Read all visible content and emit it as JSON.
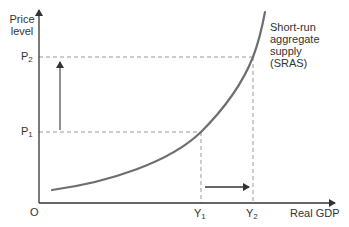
{
  "diagram": {
    "title": "Short-run aggregate supply (SRAS)",
    "y_axis": {
      "label_line1": "Price",
      "label_line2": "level"
    },
    "x_axis": {
      "label": "Real GDP",
      "origin": "O"
    },
    "curve": {
      "label_line1": "Short-run",
      "label_line2": "aggregate",
      "label_line3": "supply",
      "label_line4": "(SRAS)"
    },
    "price_levels": [
      {
        "base": "P",
        "sub": "1"
      },
      {
        "base": "P",
        "sub": "2"
      }
    ],
    "output_levels": [
      {
        "base": "Y",
        "sub": "1"
      },
      {
        "base": "Y",
        "sub": "2"
      }
    ],
    "colors": {
      "axis": "#333333",
      "curve": "#6e6e6e",
      "dashed": "#999999",
      "arrow": "#333333",
      "background": "#ffffff"
    }
  }
}
